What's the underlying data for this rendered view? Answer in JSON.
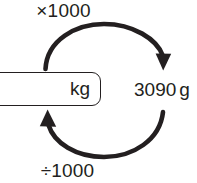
{
  "diagram": {
    "type": "unit-conversion-cycle",
    "title_fragment": "f",
    "operation_top": {
      "label": "×1000",
      "symbol": "×",
      "factor": 1000,
      "direction": "clockwise-left-to-right",
      "from": "kg",
      "to": "g"
    },
    "operation_bottom": {
      "label": "÷1000",
      "symbol": "÷",
      "factor": 1000,
      "direction": "counterclockwise-right-to-left",
      "from": "g",
      "to": "kg"
    },
    "left_node": {
      "kind": "answer-box",
      "value": "",
      "unit": "kg",
      "placeholder": ""
    },
    "right_node": {
      "kind": "static-value",
      "number": "3090",
      "unit": "g",
      "full": "3090 g"
    },
    "colors": {
      "ink": "#231f20",
      "background": "#ffffff"
    }
  }
}
